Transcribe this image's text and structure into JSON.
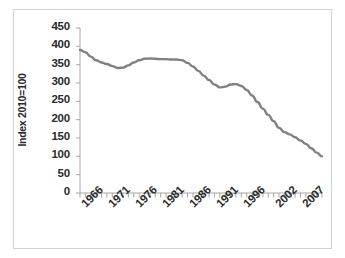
{
  "figure": {
    "background_color": "#ffffff",
    "border_color": "#d2d2d2",
    "line_color": "#808080",
    "text_color": "#2b2b2b",
    "axis_color": "#a6a6a6"
  },
  "chart_data": {
    "type": "line",
    "title": "",
    "subtitle": "",
    "xlabel": "",
    "ylabel": "Index  2010=100",
    "ylim": [
      0,
      450
    ],
    "xlim": [
      1965,
      2010
    ],
    "grid": false,
    "legend": null,
    "legend_position": "none",
    "ytick_labels": [
      "450",
      "400",
      "350",
      "300",
      "250",
      "200",
      "150",
      "100",
      "50",
      "0"
    ],
    "ytick_values": [
      450,
      400,
      350,
      300,
      250,
      200,
      150,
      100,
      50,
      0
    ],
    "xtick_labels": [
      "1966",
      "1971",
      "1976",
      "1981",
      "1986",
      "1991",
      "1996",
      "2002",
      "2007"
    ],
    "xtick_values": [
      1966,
      1971,
      1976,
      1981,
      1986,
      1991,
      1996,
      2002,
      2007
    ],
    "series": [
      {
        "name": "Index 2010=100",
        "color": "#808080",
        "x": [
          1965,
          1966,
          1967,
          1968,
          1969,
          1970,
          1971,
          1972,
          1973,
          1974,
          1975,
          1976,
          1977,
          1978,
          1979,
          1980,
          1981,
          1982,
          1983,
          1984,
          1985,
          1986,
          1987,
          1988,
          1989,
          1990,
          1991,
          1992,
          1993,
          1994,
          1995,
          1996,
          1997,
          1998,
          1999,
          2000,
          2001,
          2002,
          2003,
          2004,
          2005,
          2006,
          2007,
          2008,
          2009,
          2010
        ],
        "values": [
          390,
          384,
          372,
          362,
          356,
          352,
          346,
          341,
          342,
          348,
          356,
          362,
          366,
          367,
          366,
          365,
          365,
          364,
          364,
          362,
          355,
          345,
          333,
          320,
          308,
          296,
          288,
          290,
          296,
          297,
          292,
          281,
          266,
          248,
          230,
          213,
          196,
          178,
          166,
          160,
          152,
          143,
          134,
          122,
          110,
          100
        ]
      }
    ]
  }
}
